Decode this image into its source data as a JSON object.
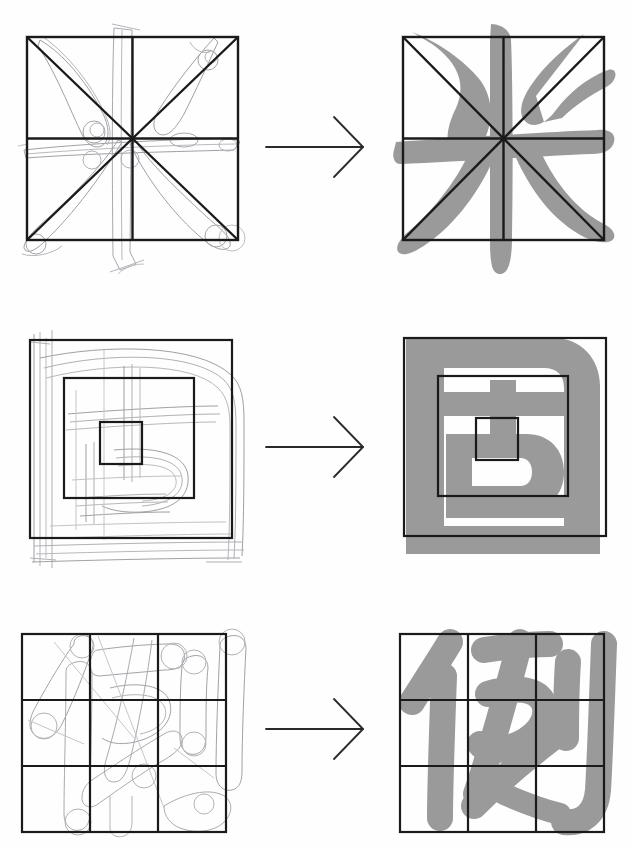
{
  "page": {
    "background_color": "#ffffff",
    "width": 633,
    "height": 846
  },
  "palette": {
    "glyph_grey": "#9a9a9a",
    "grid_black": "#1a1a1a",
    "pencil_grey": "#8d8d93",
    "pencil_light": "#b4b4ba",
    "arrow_black": "#2a2a2a",
    "paper": "#ffffff"
  },
  "legend": {
    "left_column_label": "pencil skeleton sketch in proportion grid",
    "right_column_label": "finished grey brush form in proportion grid",
    "arrow_label": "becomes"
  },
  "rows": [
    {
      "id": "row-1",
      "character": "米",
      "character_name": "mi",
      "character_meaning": "rice",
      "grid_type": "quartered square with both diagonals",
      "grid_divisions": "2 x 2 plus X diagonals",
      "stroke_count": 6,
      "sketch_note": "skeleton strokes drawn as thin outlined tubes with round terminal dots",
      "arrow": "→"
    },
    {
      "id": "row-2",
      "character": "固",
      "character_name": "gu",
      "character_meaning": "solid, firm",
      "grid_type": "three nested concentric squares",
      "grid_divisions": "outer, middle and inner square",
      "stroke_count": 8,
      "sketch_note": "enclosure drawn with repeated ruled guide lines and rounded corner sweeps",
      "arrow": "→"
    },
    {
      "id": "row-3",
      "character": "例",
      "character_name": "li",
      "character_meaning": "example",
      "grid_type": "nine square grid",
      "grid_divisions": "3 x 3",
      "stroke_count": 8,
      "sketch_note": "each stroke sketched as a rounded capsule outline showing the brush width",
      "arrow": "→"
    }
  ]
}
